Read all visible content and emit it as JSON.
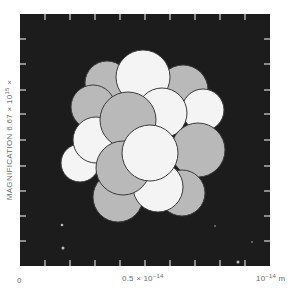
{
  "figure": {
    "background": "#ffffff",
    "panel": {
      "x": 20,
      "y": 14,
      "width": 250,
      "height": 252,
      "color": "#1c1c1c"
    },
    "tick_color": "#d8d8d8",
    "ticks_x": [
      45,
      70,
      95,
      120,
      145,
      170,
      195,
      220,
      245
    ],
    "ticks_y": [
      39,
      64,
      90,
      114,
      140,
      166,
      191,
      216,
      241
    ],
    "nucleon_colors": {
      "light": "#f4f4f4",
      "dark": "#b9b9b9",
      "outline": "#3a3a3a"
    },
    "nucleons": [
      {
        "cx": 107,
        "cy": 83,
        "r": 22,
        "tone": "dark"
      },
      {
        "cx": 183,
        "cy": 90,
        "r": 25,
        "tone": "dark"
      },
      {
        "cx": 143,
        "cy": 77,
        "r": 27,
        "tone": "light"
      },
      {
        "cx": 203,
        "cy": 110,
        "r": 21,
        "tone": "light"
      },
      {
        "cx": 93,
        "cy": 107,
        "r": 22,
        "tone": "dark"
      },
      {
        "cx": 80,
        "cy": 163,
        "r": 19,
        "tone": "light"
      },
      {
        "cx": 162,
        "cy": 113,
        "r": 25,
        "tone": "light"
      },
      {
        "cx": 96,
        "cy": 140,
        "r": 23,
        "tone": "light"
      },
      {
        "cx": 128,
        "cy": 120,
        "r": 28,
        "tone": "dark"
      },
      {
        "cx": 198,
        "cy": 150,
        "r": 27,
        "tone": "dark"
      },
      {
        "cx": 118,
        "cy": 197,
        "r": 25,
        "tone": "dark"
      },
      {
        "cx": 182,
        "cy": 193,
        "r": 23,
        "tone": "dark"
      },
      {
        "cx": 158,
        "cy": 187,
        "r": 25,
        "tone": "light"
      },
      {
        "cx": 123,
        "cy": 168,
        "r": 27,
        "tone": "dark"
      },
      {
        "cx": 150,
        "cy": 153,
        "r": 28,
        "tone": "light"
      }
    ],
    "specks": [
      {
        "cx": 62,
        "cy": 225,
        "r": 1.3
      },
      {
        "cx": 63,
        "cy": 248,
        "r": 1.5
      },
      {
        "cx": 238,
        "cy": 262,
        "r": 1.5
      },
      {
        "cx": 252,
        "cy": 242,
        "r": 0.8
      },
      {
        "cx": 215,
        "cy": 226,
        "r": 0.8
      }
    ]
  },
  "xaxis": {
    "labels": [
      {
        "text": "0",
        "x": 17
      },
      {
        "text": "0.5 × 10",
        "sup": "−14",
        "x": 122
      },
      {
        "text": "10",
        "sup": "−14",
        "suffix": " m",
        "x": 256
      }
    ]
  },
  "yaxis": {
    "label_text": "MAGNIFICATION 6.67 × 10",
    "label_sup": "15",
    "label_suffix": " ×"
  }
}
